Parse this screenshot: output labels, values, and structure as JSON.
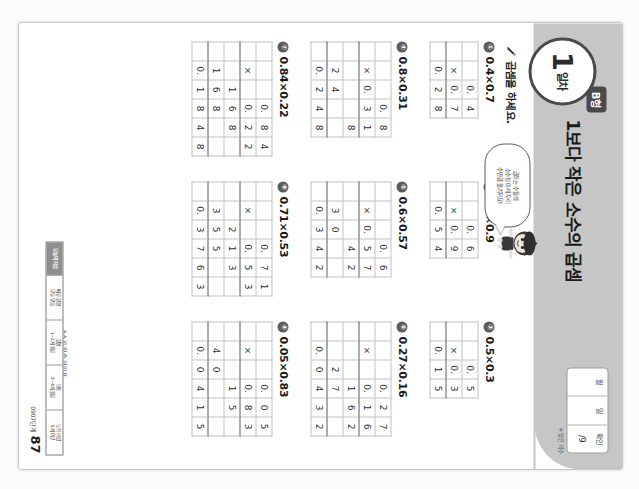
{
  "workbook": {
    "day_number": "1",
    "day_label": "일차",
    "type_badge": "B형",
    "title": "1보다 작은 소수의 곱셈",
    "instruction": "곱셈을 하세요.",
    "pencil_icon": "pencil-icon",
    "mascot_icon": "mascot-character-icon",
    "speech_bubble": {
      "line1": "곱하는 수들의",
      "line2": "소수점 아래 자리",
      "line3": "수만큼 옮겨져요!"
    },
    "date_box": {
      "cells": [
        {
          "label": "월",
          "value": ""
        },
        {
          "label": "일",
          "value": ""
        },
        {
          "label": "확인",
          "value": "/9"
        }
      ],
      "note": "※ 맞은 개수"
    }
  },
  "problems": [
    {
      "no": "①",
      "expr": "0.4×0.7",
      "cols": 4,
      "rows": [
        {
          "cells": [
            "",
            "",
            "0.",
            "4"
          ],
          "ruled": false
        },
        {
          "cells": [
            "",
            "×",
            "0.",
            "7"
          ],
          "ruled": true
        },
        {
          "cells": [
            "",
            "0.",
            "2",
            "8"
          ],
          "ruled": false
        }
      ]
    },
    {
      "no": "②",
      "expr": "0.6×0.9",
      "cols": 4,
      "rows": [
        {
          "cells": [
            "",
            "",
            "0.",
            "6"
          ],
          "ruled": false
        },
        {
          "cells": [
            "",
            "×",
            "0.",
            "9"
          ],
          "ruled": true
        },
        {
          "cells": [
            "",
            "0.",
            "5",
            "4"
          ],
          "ruled": false
        }
      ]
    },
    {
      "no": "③",
      "expr": "0.5×0.3",
      "cols": 4,
      "rows": [
        {
          "cells": [
            "",
            "",
            "0.",
            "5"
          ],
          "ruled": false
        },
        {
          "cells": [
            "",
            "×",
            "0.",
            "3"
          ],
          "ruled": true
        },
        {
          "cells": [
            "",
            "0.",
            "1",
            "5"
          ],
          "ruled": false
        }
      ]
    },
    {
      "no": "④",
      "expr": "0.8×0.31",
      "cols": 5,
      "rows": [
        {
          "cells": [
            "",
            "",
            "",
            "0.",
            "8"
          ],
          "ruled": false
        },
        {
          "cells": [
            "",
            "×",
            "0.",
            "3",
            "1"
          ],
          "ruled": true
        },
        {
          "cells": [
            "",
            "",
            "",
            "",
            "8"
          ],
          "ruled": false
        },
        {
          "cells": [
            "",
            "2",
            "4",
            "",
            ""
          ],
          "ruled": true
        },
        {
          "cells": [
            "",
            "0.",
            "2",
            "4",
            "8"
          ],
          "ruled": false
        }
      ]
    },
    {
      "no": "⑤",
      "expr": "0.6×0.57",
      "cols": 5,
      "rows": [
        {
          "cells": [
            "",
            "",
            "",
            "0.",
            "6"
          ],
          "ruled": false
        },
        {
          "cells": [
            "",
            "×",
            "0.",
            "5",
            "7"
          ],
          "ruled": true
        },
        {
          "cells": [
            "",
            "",
            "",
            "4",
            "2"
          ],
          "ruled": false
        },
        {
          "cells": [
            "",
            "3",
            "0",
            "",
            ""
          ],
          "ruled": true
        },
        {
          "cells": [
            "",
            "0.",
            "3",
            "4",
            "2"
          ],
          "ruled": false
        }
      ]
    },
    {
      "no": "⑥",
      "expr": "0.27×0.16",
      "cols": 5,
      "rows": [
        {
          "cells": [
            "",
            "",
            "",
            "0.",
            "2",
            "7"
          ],
          "ruled": false
        },
        {
          "cells": [
            "",
            "×",
            "",
            "0.",
            "1",
            "6"
          ],
          "ruled": true
        },
        {
          "cells": [
            "",
            "",
            "",
            "1",
            "6",
            "2"
          ],
          "ruled": false
        },
        {
          "cells": [
            "",
            "",
            "2",
            "7",
            "",
            ""
          ],
          "ruled": true
        },
        {
          "cells": [
            "",
            "0.",
            "0",
            "4",
            "3",
            "2"
          ],
          "ruled": false
        }
      ]
    },
    {
      "no": "⑦",
      "expr": "0.84×0.22",
      "cols": 6,
      "rows": [
        {
          "cells": [
            "",
            "",
            "",
            "0.",
            "8",
            "4"
          ],
          "ruled": false
        },
        {
          "cells": [
            "",
            "×",
            "",
            "0.",
            "2",
            "2"
          ],
          "ruled": true
        },
        {
          "cells": [
            "",
            "",
            "1",
            "6",
            "8"
          ],
          "ruled": false
        },
        {
          "cells": [
            "",
            "1",
            "6",
            "8",
            ""
          ],
          "ruled": true
        },
        {
          "cells": [
            "",
            "0.",
            "1",
            "8",
            "4",
            "8"
          ],
          "ruled": false
        }
      ]
    },
    {
      "no": "⑧",
      "expr": "0.71×0.53",
      "cols": 6,
      "rows": [
        {
          "cells": [
            "",
            "",
            "",
            "0.",
            "7",
            "1"
          ],
          "ruled": false
        },
        {
          "cells": [
            "",
            "×",
            "",
            "0.",
            "5",
            "3"
          ],
          "ruled": true
        },
        {
          "cells": [
            "",
            "",
            "2",
            "1",
            "3"
          ],
          "ruled": false
        },
        {
          "cells": [
            "",
            "3",
            "5",
            "5",
            ""
          ],
          "ruled": true
        },
        {
          "cells": [
            "",
            "0.",
            "3",
            "7",
            "6",
            "3"
          ],
          "ruled": false
        }
      ]
    },
    {
      "no": "⑨",
      "expr": "0.05×0.83",
      "cols": 6,
      "rows": [
        {
          "cells": [
            "",
            "",
            "",
            "0.",
            "0",
            "5"
          ],
          "ruled": false
        },
        {
          "cells": [
            "",
            "×",
            "",
            "0.",
            "8",
            "3"
          ],
          "ruled": true
        },
        {
          "cells": [
            "",
            "",
            "",
            "1",
            "5"
          ],
          "ruled": false
        },
        {
          "cells": [
            "",
            "4",
            "0",
            "",
            ""
          ],
          "ruled": true
        },
        {
          "cells": [
            "",
            "0.",
            "0",
            "4",
            "1",
            "5"
          ],
          "ruled": false
        }
      ]
    }
  ],
  "footer": {
    "self_check_label": "스스로 학습 관리표",
    "rubric": [
      {
        "head": "매우 잘함",
        "body": ""
      },
      {
        "head": "잘함",
        "body": ""
      },
      {
        "head": "보통",
        "body": ""
      },
      {
        "head": "노력 바람",
        "body": ""
      }
    ],
    "rubric_cells": [
      "오늘의 학습",
      "매우 잘함\n모두 맞음",
      "잘함\n1~2개 틀림",
      "보통\n3~4개 틀림",
      "노력 바람\n5개 이상"
    ],
    "stage": "0907단계",
    "page_number": "87"
  }
}
